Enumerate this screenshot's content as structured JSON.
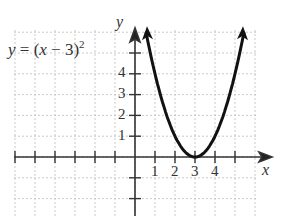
{
  "chart_data": {
    "type": "line",
    "equation": {
      "prefix": "y = (x − 3)",
      "exponent": "2"
    },
    "xlabel": "x",
    "ylabel": "y",
    "x_tick_labels": [
      "1",
      "2",
      "3",
      "4"
    ],
    "y_tick_labels": [
      "1",
      "2",
      "3",
      "4"
    ],
    "xlim": [
      -6,
      6
    ],
    "ylim": [
      -3,
      6
    ],
    "grid": true,
    "series": [
      {
        "name": "y = (x - 3)^2",
        "x": [
          0.6,
          1,
          1.5,
          2,
          2.5,
          3,
          3.5,
          4,
          4.5,
          5,
          5.4
        ],
        "y": [
          5.76,
          4,
          2.25,
          1,
          0.25,
          0,
          0.25,
          1,
          2.25,
          4,
          5.76
        ]
      }
    ],
    "vertex": [
      3,
      0
    ]
  },
  "colors": {
    "curve": "#111111",
    "axis": "#333333",
    "grid": "#bbbbbb"
  }
}
